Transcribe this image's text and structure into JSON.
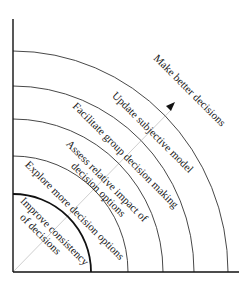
{
  "diagram": {
    "type": "concentric-quadrant-arcs",
    "direction_arrow": "outward-along-diagonal",
    "rings": [
      {
        "level": 1,
        "lines": [
          "Improve consistency",
          "of decisions"
        ]
      },
      {
        "level": 2,
        "lines": [
          "Explore more decision options"
        ]
      },
      {
        "level": 3,
        "lines": [
          "Assess relative impact of",
          "decision options"
        ]
      },
      {
        "level": 4,
        "lines": [
          "Facilitate group decision making"
        ]
      },
      {
        "level": 5,
        "lines": [
          "Update subjective model"
        ]
      },
      {
        "level": 6,
        "lines": [
          "Make better decisions"
        ]
      }
    ],
    "icons": {
      "arrow": "arrowhead-icon"
    },
    "colors": {
      "lines": "#333333",
      "axis": "#111111",
      "diagonal": "#cfcfcf",
      "text": "#1a1a1a"
    }
  }
}
